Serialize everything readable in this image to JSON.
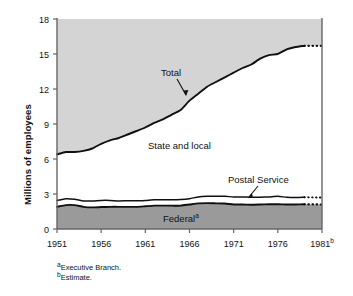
{
  "chart_data": {
    "type": "area",
    "title": "",
    "subtitle": "",
    "xlabel": "",
    "ylabel": "Millions of employees",
    "xlim": [
      1951,
      1981
    ],
    "ylim": [
      0,
      18
    ],
    "grid": false,
    "legend_position": "inline-annotations",
    "x_ticks": [
      "1951",
      "1956",
      "1961",
      "1966",
      "1971",
      "1976",
      "1981"
    ],
    "x_tick_suffixes": [
      "",
      "",
      "",
      "",
      "",
      "",
      "b"
    ],
    "y_ticks": [
      0,
      3,
      6,
      9,
      12,
      15,
      18
    ],
    "x": [
      1951,
      1952,
      1953,
      1954,
      1955,
      1956,
      1957,
      1958,
      1959,
      1960,
      1961,
      1962,
      1963,
      1964,
      1965,
      1966,
      1967,
      1968,
      1969,
      1970,
      1971,
      1972,
      1973,
      1974,
      1975,
      1976,
      1977,
      1978,
      1979,
      1980,
      1981
    ],
    "series": [
      {
        "name": "Total",
        "style": "solid-line-with-dotted-estimate",
        "values": [
          6.4,
          6.6,
          6.6,
          6.7,
          6.9,
          7.3,
          7.6,
          7.8,
          8.1,
          8.4,
          8.7,
          9.1,
          9.4,
          9.8,
          10.2,
          11.0,
          11.6,
          12.2,
          12.6,
          13.0,
          13.4,
          13.8,
          14.1,
          14.6,
          14.9,
          15.0,
          15.4,
          15.6,
          15.7,
          15.7,
          15.7
        ]
      },
      {
        "name": "Postal Service",
        "style": "solid-line-with-dotted-estimate",
        "values": [
          2.45,
          2.6,
          2.55,
          2.4,
          2.4,
          2.45,
          2.45,
          2.4,
          2.42,
          2.42,
          2.45,
          2.5,
          2.5,
          2.5,
          2.53,
          2.6,
          2.75,
          2.8,
          2.8,
          2.8,
          2.75,
          2.75,
          2.72,
          2.73,
          2.75,
          2.8,
          2.72,
          2.7,
          2.72,
          2.7,
          2.7
        ]
      },
      {
        "name": "Federal",
        "name_suffix": "a",
        "style": "solid-line-filled-dark-with-dotted-estimate",
        "values": [
          1.9,
          2.05,
          2.05,
          1.9,
          1.85,
          1.88,
          1.9,
          1.9,
          1.9,
          1.9,
          1.95,
          2.0,
          2.0,
          2.0,
          2.0,
          2.1,
          2.2,
          2.22,
          2.2,
          2.18,
          2.1,
          2.1,
          2.08,
          2.1,
          2.12,
          2.12,
          2.1,
          2.1,
          2.12,
          2.1,
          2.1
        ]
      }
    ],
    "region_labels": [
      {
        "name": "State and local",
        "note": "area between Total and Postal Service lines, unfilled white"
      },
      {
        "name": "Federal",
        "note": "dark gray filled area below Federal line"
      }
    ],
    "annotations": [
      {
        "label": "Total",
        "kind": "arrow-callout"
      },
      {
        "label": "State and local",
        "kind": "region-label"
      },
      {
        "label": "Postal Service",
        "kind": "arrow-callout"
      },
      {
        "label": "Federal",
        "suffix": "a",
        "kind": "region-label"
      }
    ],
    "footnotes": [
      {
        "marker": "a",
        "text": "Executive Branch."
      },
      {
        "marker": "b",
        "text": "Estimate."
      }
    ],
    "colors": {
      "upper_area_fill": "#d4d4d4",
      "federal_area_fill": "#9a9a9a",
      "line": "#101010",
      "axis": "#555555",
      "background": "#ffffff",
      "text": "#111111"
    }
  }
}
